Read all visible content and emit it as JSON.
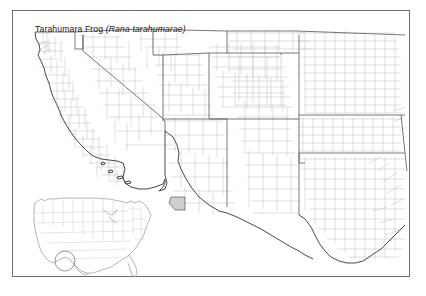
{
  "figure": {
    "kind": "species-range-map",
    "width": 426,
    "height": 296,
    "background_color": "#ffffff"
  },
  "title": {
    "common_name": "Tarahumara Frog ",
    "scientific_name": "(Rana tarahumarae)",
    "full_text": "Tarahumara Frog (Rana tarahumarae)",
    "font_size_px": 8.6,
    "color": "#1a1a1a"
  },
  "frame": {
    "x": 12,
    "y": 10,
    "width": 398,
    "height": 267,
    "border_color": "#6e6e6e",
    "border_width_px": 1.3
  },
  "map": {
    "region": "Southwestern United States",
    "projection_note": "county-level political outline",
    "state_line_color": "#5a5a5a",
    "county_line_color": "#b9b9b9",
    "coast_line_color": "#7a7a7a",
    "border_line_color": "#3d3d3d",
    "fill_color": "#ffffff",
    "states_visible": [
      "California",
      "Nevada",
      "Oregon",
      "Idaho",
      "Utah",
      "Arizona",
      "New Mexico",
      "Colorado",
      "Wyoming",
      "Nebraska",
      "Kansas",
      "Oklahoma",
      "Texas",
      "Arkansas",
      "Louisiana",
      "Missouri"
    ]
  },
  "range": {
    "label": "occupied county",
    "fill_color": "#cfcfcf",
    "stroke_color": "#5a5a5a",
    "counties": [
      {
        "name": "Santa Cruz County, Arizona",
        "x": 170,
        "y": 197
      }
    ]
  },
  "inset": {
    "label": "United States locator inset",
    "x": 18,
    "y": 186,
    "width": 124,
    "height": 88,
    "outline_color": "#9a9a9a",
    "state_line_color": "#c4c4c4",
    "marker": {
      "shape": "circle",
      "x": 52,
      "y": 250,
      "radius": 10,
      "stroke_color": "#7a7a7a",
      "fill": "none"
    }
  }
}
